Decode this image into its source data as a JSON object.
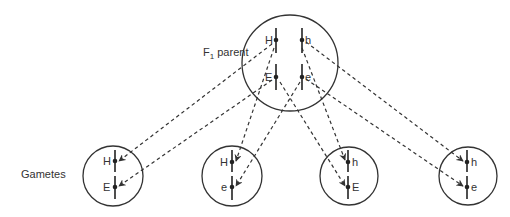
{
  "labels": {
    "parent": "F",
    "parent_sub": "1",
    "parent_suffix": " parent",
    "gametes": "Gametes"
  },
  "parent": {
    "alleles": {
      "top_left": "H",
      "top_right": "h",
      "bottom_left": "E",
      "bottom_right": "e"
    }
  },
  "gametes": [
    {
      "top": "H",
      "bottom": "E"
    },
    {
      "top": "H",
      "bottom": "e"
    },
    {
      "top": "h",
      "bottom": "E"
    },
    {
      "top": "h",
      "bottom": "e"
    }
  ],
  "colors": {
    "line": "#333333",
    "background": "#ffffff"
  }
}
